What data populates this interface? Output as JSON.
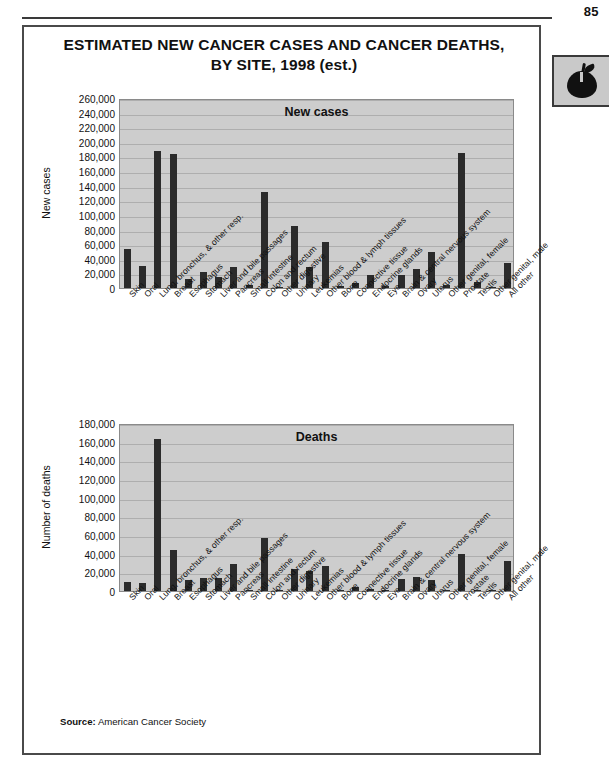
{
  "page": {
    "number": "85",
    "title_line1": "ESTIMATED NEW CANCER CASES AND CANCER DEATHS,",
    "title_line2": "BY SITE, 1998 (est.)",
    "source_label": "Source:",
    "source_value": "American Cancer Society",
    "tab_icon": "apple-icon"
  },
  "chart_data": [
    {
      "type": "bar",
      "title": "New cases",
      "xlabel": "",
      "ylabel": "New cases",
      "ylim": [
        0,
        260000
      ],
      "ytick_step": 20000,
      "grid": true,
      "legend": "none",
      "yticks": [
        "0",
        "20,000",
        "40,000",
        "60,000",
        "80,000",
        "100,000",
        "120,000",
        "140,000",
        "160,000",
        "180,000",
        "200,000",
        "220,000",
        "240,000",
        "260,000"
      ],
      "categories": [
        "Skin",
        "Oral",
        "Lung, bronchus, & other resp.",
        "Breast",
        "Esophagus",
        "Stomach",
        "Liver and bile passages",
        "Pancreas",
        "Small intestine",
        "Colon and rectum",
        "Other digestive",
        "Urinary",
        "Leukemias",
        "Other blood & lymph tissues",
        "Bone",
        "Connective tissue",
        "Endocrine glands",
        "Eye",
        "Brain & central nervous system",
        "Ovary",
        "Uterus",
        "Other genital, female",
        "Prostate",
        "Testis",
        "Other genital, male",
        "All other"
      ],
      "values": [
        54000,
        30300,
        187600,
        182800,
        12300,
        22600,
        15500,
        29000,
        4800,
        131600,
        2000,
        85200,
        28700,
        63600,
        2500,
        7000,
        18100,
        2100,
        17400,
        25400,
        49500,
        3800,
        184500,
        7600,
        1400,
        34000
      ]
    },
    {
      "type": "bar",
      "title": "Deaths",
      "xlabel": "",
      "ylabel": "Number of deaths",
      "ylim": [
        0,
        180000
      ],
      "ytick_step": 20000,
      "grid": true,
      "legend": "none",
      "yticks": [
        "0",
        "20,000",
        "40,000",
        "60,000",
        "80,000",
        "100,000",
        "120,000",
        "140,000",
        "160,000",
        "180,000"
      ],
      "categories": [
        "Skin",
        "Oral",
        "Lung, bronchus, & other resp.",
        "Breast",
        "Esophagus",
        "Stomach",
        "Liver and bile passages",
        "Pancreas",
        "Small intestine",
        "Colon and rectum",
        "Other digestive",
        "Urinary",
        "Leukemias",
        "Other blood & lymph tissues",
        "Bone",
        "Connective tissue",
        "Endocrine glands",
        "Eye",
        "Brain & central nervous system",
        "Ovary",
        "Uterus",
        "Other genital, female",
        "Prostate",
        "Testis",
        "Other genital, male",
        "All other"
      ],
      "values": [
        9200,
        8100,
        163400,
        43900,
        11900,
        13700,
        13600,
        28900,
        1200,
        56500,
        1000,
        23200,
        21600,
        26300,
        1400,
        3900,
        2000,
        300,
        13300,
        14500,
        11300,
        1000,
        39200,
        400,
        300,
        32500
      ]
    }
  ]
}
